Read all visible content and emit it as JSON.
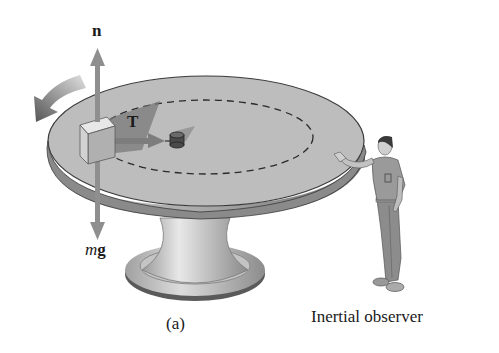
{
  "figure": {
    "caption": "(a)",
    "observer_label": "Inertial observer",
    "vectors": {
      "normal_force": {
        "symbol": "n"
      },
      "tension": {
        "symbol": "T"
      },
      "weight": {
        "symbol_italic": "m",
        "symbol_bold": "g"
      }
    },
    "objects": [
      "rotating turntable",
      "block on turntable edge",
      "central peg with string",
      "dashed circular path",
      "rotation direction arrow",
      "standing man observer"
    ],
    "colors": {
      "table_top": "#bdbdbd",
      "table_rim": "#8a8a8a",
      "arrow_fill": "#8f8f8f",
      "shadow": "#7a7a7a",
      "text": "#1a1a1a"
    }
  }
}
